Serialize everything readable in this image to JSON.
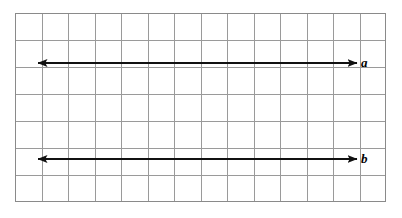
{
  "figure": {
    "type": "geometry-diagram",
    "background_color": "#ffffff"
  },
  "grid": {
    "name": "square-grid",
    "columns": 14,
    "rows": 7,
    "cell_size_px": 26.5,
    "origin_x_px": 15,
    "origin_y_px": 13,
    "width_px": 371,
    "height_px": 189,
    "line_color": "#9a9a9a",
    "border_color": "#8a8a8a",
    "line_width_px": 1
  },
  "lines": [
    {
      "id": "line-a",
      "label": "a",
      "color": "#111111",
      "thickness_px": 2.2,
      "arrowheads": "both",
      "y_px": 63,
      "x_start_px": 38,
      "x_end_px": 357,
      "grid_row": 2,
      "label_x_px": 361,
      "label_y_px": 56
    },
    {
      "id": "line-b",
      "label": "b",
      "color": "#111111",
      "thickness_px": 2.2,
      "arrowheads": "both",
      "y_px": 159,
      "x_start_px": 38,
      "x_end_px": 357,
      "grid_row": 6,
      "label_x_px": 361,
      "label_y_px": 152
    }
  ],
  "colors": {
    "grid_line": "#9a9a9a",
    "grid_border": "#8a8a8a",
    "line_stroke": "#111111",
    "label_text": "#000000",
    "page_background": "#ffffff"
  }
}
